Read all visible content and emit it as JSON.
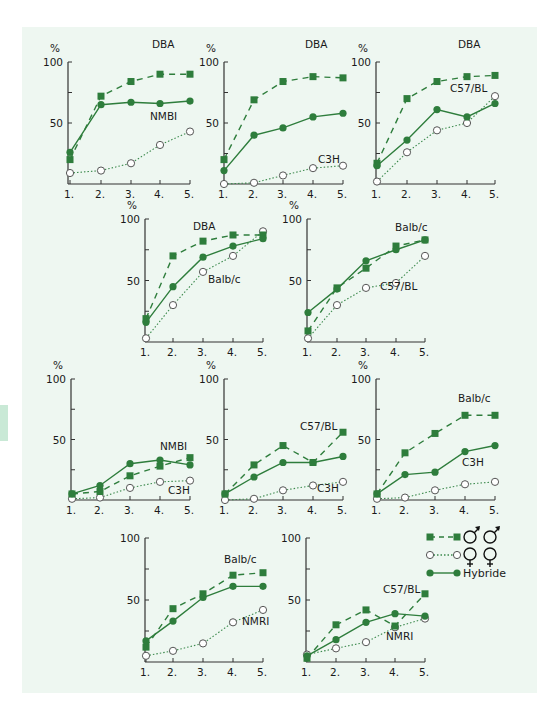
{
  "colors": {
    "background_panel": "#eef7f1",
    "series_green": "#2e7d3c",
    "axis": "#333333",
    "open_marker_fill": "#ffffff"
  },
  "legend": {
    "items": [
      {
        "marker": "filled-square",
        "line": "dashed",
        "label": "♂♂",
        "symbol": "male-male-icon"
      },
      {
        "marker": "open-circle",
        "line": "dotted",
        "label": "♀♀",
        "symbol": "female-female-icon"
      },
      {
        "marker": "filled-circle",
        "line": "solid",
        "label": "Hybride"
      }
    ]
  },
  "chart_data": [
    {
      "type": "line",
      "panel": 1,
      "categories": [
        "1.",
        "2.",
        "3.",
        "4.",
        "5."
      ],
      "ylabel": "%",
      "yticks": [
        "100",
        "50"
      ],
      "ylim": [
        0,
        100
      ],
      "series": [
        {
          "name": "DBA",
          "style": "dashed-square",
          "values": [
            20,
            72,
            84,
            90,
            90
          ]
        },
        {
          "name": "Hybride",
          "style": "solid-circle",
          "values": [
            26,
            65,
            67,
            66,
            68
          ]
        },
        {
          "name": "NMBI",
          "style": "dotted-open",
          "values": [
            9,
            11,
            17,
            32,
            43
          ]
        }
      ],
      "labels": [
        {
          "text": "DBA",
          "series": 0
        },
        {
          "text": "NMBI",
          "series": 2
        }
      ]
    },
    {
      "type": "line",
      "panel": 2,
      "categories": [
        "1.",
        "2.",
        "3.",
        "4.",
        "5."
      ],
      "ylabel": "%",
      "yticks": [
        "100",
        "50"
      ],
      "ylim": [
        0,
        100
      ],
      "series": [
        {
          "name": "DBA",
          "style": "dashed-square",
          "values": [
            20,
            69,
            84,
            88,
            87
          ]
        },
        {
          "name": "Hybride",
          "style": "solid-circle",
          "values": [
            11,
            40,
            46,
            55,
            58
          ]
        },
        {
          "name": "C3H",
          "style": "dotted-open",
          "values": [
            0,
            1,
            7,
            13,
            15
          ]
        }
      ],
      "labels": [
        {
          "text": "DBA",
          "series": 0
        },
        {
          "text": "C3H",
          "series": 2
        }
      ]
    },
    {
      "type": "line",
      "panel": 3,
      "categories": [
        "1.",
        "2.",
        "3.",
        "4.",
        "5."
      ],
      "ylabel": "%",
      "yticks": [
        "100",
        "50"
      ],
      "ylim": [
        0,
        100
      ],
      "series": [
        {
          "name": "DBA",
          "style": "dashed-square",
          "values": [
            17,
            70,
            84,
            88,
            89
          ]
        },
        {
          "name": "Hybride",
          "style": "solid-circle",
          "values": [
            15,
            36,
            61,
            55,
            66
          ]
        },
        {
          "name": "C57/BL",
          "style": "dotted-open",
          "values": [
            2,
            26,
            44,
            50,
            72
          ]
        }
      ],
      "labels": [
        {
          "text": "DBA",
          "series": 0
        },
        {
          "text": "C57/BL",
          "series": 2
        }
      ]
    },
    {
      "type": "line",
      "panel": 4,
      "categories": [
        "1.",
        "2.",
        "3.",
        "4.",
        "5."
      ],
      "ylabel": "%",
      "yticks": [
        "100",
        "50"
      ],
      "ylim": [
        0,
        100
      ],
      "series": [
        {
          "name": "DBA",
          "style": "dashed-square",
          "values": [
            19,
            70,
            82,
            87,
            87
          ]
        },
        {
          "name": "Hybride",
          "style": "solid-circle",
          "values": [
            16,
            45,
            69,
            78,
            84
          ]
        },
        {
          "name": "Balb/c",
          "style": "dotted-open",
          "values": [
            3,
            30,
            57,
            70,
            90
          ]
        }
      ],
      "labels": [
        {
          "text": "DBA",
          "series": 0
        },
        {
          "text": "Balb/c",
          "series": 2
        }
      ]
    },
    {
      "type": "line",
      "panel": 5,
      "categories": [
        "1.",
        "2.",
        "3.",
        "4.",
        "5."
      ],
      "ylabel": "%",
      "yticks": [
        "100",
        "50"
      ],
      "ylim": [
        0,
        100
      ],
      "series": [
        {
          "name": "Balb/c",
          "style": "dashed-square",
          "values": [
            9,
            44,
            60,
            78,
            83
          ]
        },
        {
          "name": "Hybride",
          "style": "solid-circle",
          "values": [
            24,
            43,
            66,
            75,
            83
          ]
        },
        {
          "name": "C57/BL",
          "style": "dotted-open",
          "values": [
            3,
            30,
            44,
            48,
            70
          ]
        }
      ],
      "labels": [
        {
          "text": "Balb/c",
          "series": 0
        },
        {
          "text": "C57/BL",
          "series": 2
        }
      ]
    },
    {
      "type": "line",
      "panel": 6,
      "categories": [
        "1.",
        "2.",
        "3.",
        "4.",
        "5."
      ],
      "ylabel": "%",
      "yticks": [
        "100",
        "50"
      ],
      "ylim": [
        0,
        100
      ],
      "series": [
        {
          "name": "NMBI",
          "style": "dashed-square",
          "values": [
            5,
            7,
            20,
            28,
            35
          ]
        },
        {
          "name": "Hybride",
          "style": "solid-circle",
          "values": [
            5,
            12,
            30,
            33,
            29
          ]
        },
        {
          "name": "C3H",
          "style": "dotted-open",
          "values": [
            1,
            2,
            10,
            15,
            16
          ]
        }
      ],
      "labels": [
        {
          "text": "NMBI",
          "series": 0
        },
        {
          "text": "C3H",
          "series": 2
        }
      ]
    },
    {
      "type": "line",
      "panel": 7,
      "categories": [
        "1.",
        "2.",
        "3.",
        "4.",
        "5."
      ],
      "ylabel": "%",
      "yticks": [
        "100",
        "50"
      ],
      "ylim": [
        0,
        100
      ],
      "series": [
        {
          "name": "C57/BL",
          "style": "dashed-square",
          "values": [
            5,
            29,
            45,
            31,
            56
          ]
        },
        {
          "name": "Hybride",
          "style": "solid-circle",
          "values": [
            5,
            19,
            31,
            31,
            36
          ]
        },
        {
          "name": "C3H",
          "style": "dotted-open",
          "values": [
            0,
            1,
            8,
            12,
            15
          ]
        }
      ],
      "labels": [
        {
          "text": "C57/BL",
          "series": 0
        },
        {
          "text": "C3H",
          "series": 2
        }
      ]
    },
    {
      "type": "line",
      "panel": 8,
      "categories": [
        "1.",
        "2.",
        "3.",
        "4.",
        "5."
      ],
      "ylabel": "%",
      "yticks": [
        "100",
        "50"
      ],
      "ylim": [
        0,
        100
      ],
      "series": [
        {
          "name": "Balb/c",
          "style": "dashed-square",
          "values": [
            5,
            39,
            55,
            70,
            70
          ]
        },
        {
          "name": "Hybride",
          "style": "solid-circle",
          "values": [
            5,
            21,
            23,
            40,
            45
          ]
        },
        {
          "name": "C3H",
          "style": "dotted-open",
          "values": [
            1,
            2,
            8,
            13,
            15
          ]
        }
      ],
      "labels": [
        {
          "text": "Balb/c",
          "series": 0
        },
        {
          "text": "C3H",
          "series": 2
        }
      ]
    },
    {
      "type": "line",
      "panel": 9,
      "categories": [
        "1.",
        "2.",
        "3.",
        "4.",
        "5."
      ],
      "ylabel": "",
      "yticks": [
        "100",
        "50"
      ],
      "ylim": [
        0,
        100
      ],
      "series": [
        {
          "name": "Balb/c",
          "style": "dashed-square",
          "values": [
            12,
            43,
            55,
            70,
            72
          ]
        },
        {
          "name": "Hybride",
          "style": "solid-circle",
          "values": [
            17,
            33,
            52,
            61,
            61
          ]
        },
        {
          "name": "NMRI",
          "style": "dotted-open",
          "values": [
            5,
            9,
            15,
            32,
            42
          ]
        }
      ],
      "labels": [
        {
          "text": "Balb/c",
          "series": 0
        },
        {
          "text": "NMRI",
          "series": 2
        }
      ]
    },
    {
      "type": "line",
      "panel": 10,
      "categories": [
        "1.",
        "2.",
        "3.",
        "4.",
        "5."
      ],
      "ylabel": "",
      "yticks": [
        "100",
        "50"
      ],
      "ylim": [
        0,
        100
      ],
      "series": [
        {
          "name": "C57/BL",
          "style": "dashed-square",
          "values": [
            3,
            30,
            42,
            29,
            55
          ]
        },
        {
          "name": "Hybride",
          "style": "solid-circle",
          "values": [
            5,
            18,
            32,
            39,
            37
          ]
        },
        {
          "name": "NMRI",
          "style": "dotted-open",
          "values": [
            6,
            11,
            16,
            28,
            35
          ]
        }
      ],
      "labels": [
        {
          "text": "C57/BL",
          "series": 0
        },
        {
          "text": "NMRI",
          "series": 2
        }
      ]
    }
  ]
}
